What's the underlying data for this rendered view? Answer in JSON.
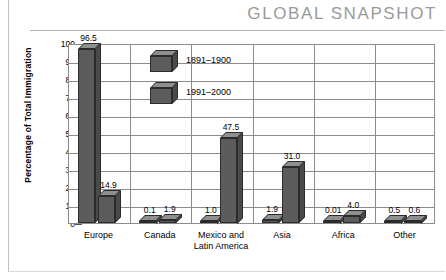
{
  "header": {
    "title": "GLOBAL SNAPSHOT"
  },
  "chart_data": {
    "type": "bar",
    "title": "",
    "xlabel": "",
    "ylabel": "Percentage of Total Immigration",
    "ylim": [
      0,
      100
    ],
    "yticks": [
      0,
      10,
      20,
      30,
      40,
      50,
      60,
      70,
      80,
      90,
      100
    ],
    "grid": true,
    "legend_position": "inside-top-left",
    "categories": [
      "Europe",
      "Canada",
      "Mexico and\nLatin America",
      "Asia",
      "Africa",
      "Other"
    ],
    "series": [
      {
        "name": "1891–1900",
        "values": [
          96.5,
          0.1,
          1.0,
          1.9,
          0.01,
          0.5
        ],
        "labels": [
          "96.5",
          "0.1",
          "1.0",
          "1.9",
          "0.01",
          "0.5"
        ]
      },
      {
        "name": "1991–2000",
        "values": [
          14.9,
          1.9,
          47.5,
          31.0,
          4.0,
          0.6
        ],
        "labels": [
          "14.9",
          "1.9",
          "47.5",
          "31.0",
          "4.0",
          "0.6"
        ]
      }
    ],
    "bar_color_front": "#5c5c5c",
    "bar_color_top": "#8f8f8f",
    "bar_color_side": "#4a4a4a",
    "axis_color": "#8c8c8c",
    "header_color": "#9a9a9a"
  }
}
